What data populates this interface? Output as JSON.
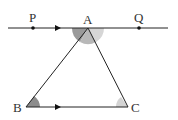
{
  "diagram": {
    "type": "geometry",
    "points": {
      "P": {
        "label": "P",
        "x": 33,
        "y": 28
      },
      "A": {
        "label": "A",
        "x": 88,
        "y": 28
      },
      "Q": {
        "label": "Q",
        "x": 139,
        "y": 28
      },
      "B": {
        "label": "B",
        "x": 26,
        "y": 107
      },
      "C": {
        "label": "C",
        "x": 128,
        "y": 107
      }
    },
    "line_PQ": {
      "x1": 8,
      "x2": 168,
      "y": 28
    },
    "colors": {
      "line": "#222222",
      "angle_dark": "#8c8c8c",
      "angle_mid": "#b0b0b0",
      "angle_light": "#d4d4d4"
    }
  }
}
